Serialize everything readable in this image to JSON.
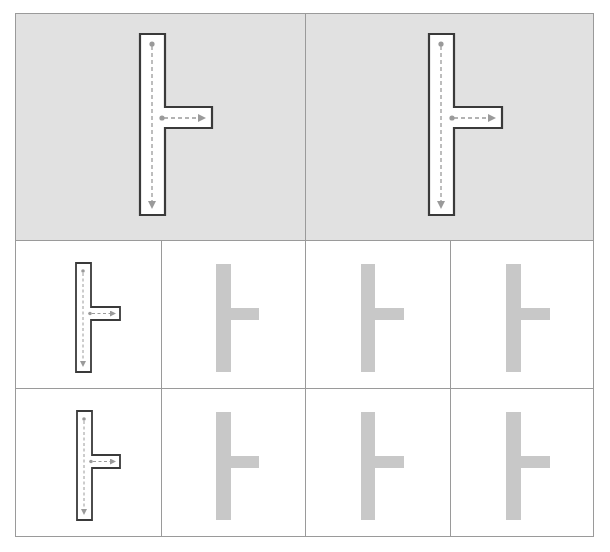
{
  "colors": {
    "top_row_background": "#e1e1e1",
    "cell_background": "#ffffff",
    "grid_line": "#9a9a9a",
    "outline_stroke": "#3a3a3a",
    "arrow_stroke": "#9a9a9a",
    "solid_fill": "#c8c8c8"
  },
  "layout": {
    "rows": 3,
    "top_row_cells": 2,
    "lower_row_cells": 4
  },
  "shapes": [
    {
      "cell": "r1c1",
      "style": "outlined-with-arrows",
      "size": "large"
    },
    {
      "cell": "r1c2",
      "style": "outlined-with-arrows",
      "size": "large"
    },
    {
      "cell": "r2c1",
      "style": "outlined-with-arrows",
      "size": "small"
    },
    {
      "cell": "r2c2",
      "style": "solid-gray",
      "size": "small"
    },
    {
      "cell": "r2c3",
      "style": "solid-gray",
      "size": "small"
    },
    {
      "cell": "r2c4",
      "style": "solid-gray",
      "size": "small"
    },
    {
      "cell": "r3c1",
      "style": "outlined-with-arrows",
      "size": "small"
    },
    {
      "cell": "r3c2",
      "style": "solid-gray",
      "size": "small"
    },
    {
      "cell": "r3c3",
      "style": "solid-gray",
      "size": "small"
    },
    {
      "cell": "r3c4",
      "style": "solid-gray",
      "size": "small"
    }
  ]
}
